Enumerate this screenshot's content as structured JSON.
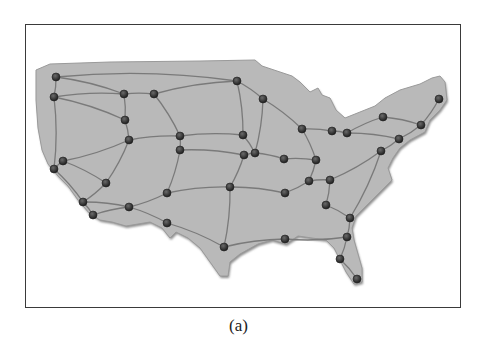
{
  "figure": {
    "caption": "(a)",
    "frame": {
      "x": 25,
      "y": 24,
      "width": 436,
      "height": 284,
      "stroke": "#3a3a3a"
    },
    "colors": {
      "land": "#b9b9b9",
      "land_shadow": "#8e8e8e",
      "road": "#7a7a7a",
      "node": "#2a2a2a",
      "node_highlight": "#6a6a6a"
    }
  },
  "map": {
    "title": "Continental United States road network",
    "outline": "M36,70 L50,64 L110,62 L200,61 L255,60 L262,66 L280,72 L292,76 L300,82 L310,92 L318,88 L322,95 L330,98 L336,110 L345,118 L360,112 L375,106 L385,98 L400,90 L420,84 L432,78 L440,76 L445,82 L447,100 L440,110 L430,120 L425,132 L410,140 L400,148 L393,158 L388,168 L392,180 L380,192 L368,204 L356,216 L352,228 L354,240 L358,254 L362,268 L362,282 L354,284 L346,272 L340,260 L334,248 L326,240 L312,238 L298,236 L286,244 L272,240 L258,244 L240,254 L230,262 L228,276 L220,276 L210,262 L200,248 L188,238 L176,232 L170,238 L162,228 L150,222 L138,224 L126,226 L112,222 L100,220 L90,214 L78,200 L68,186 L58,176 L48,164 L42,150 L38,128 L36,100 Z",
    "nodes": [
      {
        "id": 1,
        "x": 56,
        "y": 77
      },
      {
        "id": 2,
        "x": 54,
        "y": 97
      },
      {
        "id": 3,
        "x": 124,
        "y": 94
      },
      {
        "id": 4,
        "x": 154,
        "y": 94
      },
      {
        "id": 5,
        "x": 237,
        "y": 81
      },
      {
        "id": 6,
        "x": 263,
        "y": 99
      },
      {
        "id": 7,
        "x": 125,
        "y": 120
      },
      {
        "id": 8,
        "x": 129,
        "y": 140
      },
      {
        "id": 9,
        "x": 180,
        "y": 136
      },
      {
        "id": 10,
        "x": 180,
        "y": 150
      },
      {
        "id": 11,
        "x": 243,
        "y": 135
      },
      {
        "id": 12,
        "x": 244,
        "y": 155
      },
      {
        "id": 13,
        "x": 255,
        "y": 153
      },
      {
        "id": 14,
        "x": 63,
        "y": 161
      },
      {
        "id": 15,
        "x": 54,
        "y": 169
      },
      {
        "id": 16,
        "x": 106,
        "y": 183
      },
      {
        "id": 17,
        "x": 167,
        "y": 193
      },
      {
        "id": 18,
        "x": 230,
        "y": 187
      },
      {
        "id": 19,
        "x": 83,
        "y": 202
      },
      {
        "id": 20,
        "x": 93,
        "y": 215
      },
      {
        "id": 21,
        "x": 129,
        "y": 207
      },
      {
        "id": 22,
        "x": 167,
        "y": 223
      },
      {
        "id": 23,
        "x": 224,
        "y": 247
      },
      {
        "id": 24,
        "x": 302,
        "y": 129
      },
      {
        "id": 25,
        "x": 332,
        "y": 131
      },
      {
        "id": 26,
        "x": 347,
        "y": 133
      },
      {
        "id": 27,
        "x": 383,
        "y": 117
      },
      {
        "id": 28,
        "x": 439,
        "y": 99
      },
      {
        "id": 29,
        "x": 421,
        "y": 125
      },
      {
        "id": 30,
        "x": 399,
        "y": 139
      },
      {
        "id": 31,
        "x": 381,
        "y": 151
      },
      {
        "id": 32,
        "x": 284,
        "y": 159
      },
      {
        "id": 33,
        "x": 316,
        "y": 160
      },
      {
        "id": 34,
        "x": 309,
        "y": 181
      },
      {
        "id": 35,
        "x": 330,
        "y": 180
      },
      {
        "id": 36,
        "x": 285,
        "y": 193
      },
      {
        "id": 37,
        "x": 326,
        "y": 205
      },
      {
        "id": 38,
        "x": 350,
        "y": 218
      },
      {
        "id": 39,
        "x": 347,
        "y": 237
      },
      {
        "id": 40,
        "x": 285,
        "y": 239
      },
      {
        "id": 41,
        "x": 340,
        "y": 259
      },
      {
        "id": 42,
        "x": 357,
        "y": 279
      }
    ],
    "roads": [
      [
        1,
        3
      ],
      [
        3,
        4
      ],
      [
        4,
        5
      ],
      [
        5,
        6
      ],
      [
        2,
        3
      ],
      [
        1,
        2
      ],
      [
        2,
        15
      ],
      [
        3,
        7
      ],
      [
        7,
        8
      ],
      [
        2,
        7
      ],
      [
        4,
        9
      ],
      [
        8,
        9
      ],
      [
        9,
        11
      ],
      [
        10,
        12
      ],
      [
        9,
        10
      ],
      [
        5,
        11
      ],
      [
        11,
        13
      ],
      [
        6,
        13
      ],
      [
        12,
        13
      ],
      [
        8,
        14
      ],
      [
        14,
        16
      ],
      [
        15,
        19
      ],
      [
        16,
        19
      ],
      [
        8,
        16
      ],
      [
        10,
        17
      ],
      [
        17,
        18
      ],
      [
        12,
        18
      ],
      [
        19,
        20
      ],
      [
        19,
        21
      ],
      [
        20,
        21
      ],
      [
        21,
        22
      ],
      [
        22,
        23
      ],
      [
        23,
        40
      ],
      [
        18,
        23
      ],
      [
        17,
        21
      ],
      [
        13,
        32
      ],
      [
        32,
        33
      ],
      [
        6,
        24
      ],
      [
        24,
        33
      ],
      [
        24,
        25
      ],
      [
        25,
        26
      ],
      [
        26,
        27
      ],
      [
        27,
        29
      ],
      [
        28,
        29
      ],
      [
        29,
        30
      ],
      [
        26,
        30
      ],
      [
        30,
        31
      ],
      [
        31,
        35
      ],
      [
        33,
        34
      ],
      [
        34,
        35
      ],
      [
        34,
        36
      ],
      [
        18,
        36
      ],
      [
        35,
        37
      ],
      [
        37,
        38
      ],
      [
        31,
        38
      ],
      [
        38,
        39
      ],
      [
        39,
        40
      ],
      [
        39,
        41
      ],
      [
        41,
        42
      ],
      [
        15,
        14
      ],
      [
        1,
        5
      ]
    ]
  }
}
